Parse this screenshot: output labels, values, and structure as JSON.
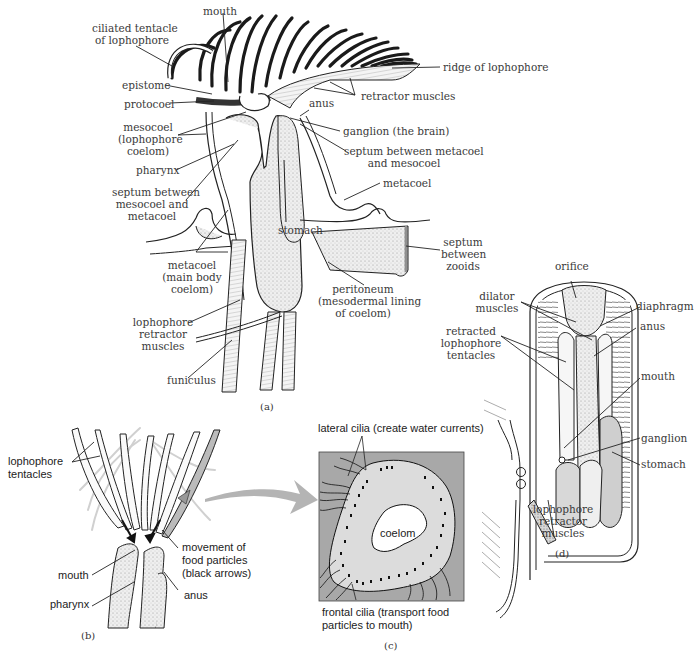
{
  "figure": {
    "panels": [
      {
        "id": "a",
        "caption": "(a)",
        "labels": [
          {
            "key": "mouth",
            "lines": [
              "mouth"
            ]
          },
          {
            "key": "ciliated_tentacle",
            "lines": [
              "ciliated tentacle",
              "of lophophore"
            ]
          },
          {
            "key": "epistome",
            "lines": [
              "epistome"
            ]
          },
          {
            "key": "protocoel",
            "lines": [
              "protocoel"
            ]
          },
          {
            "key": "mesocoel",
            "lines": [
              "mesocoel",
              "(lophophore",
              "coelom)"
            ]
          },
          {
            "key": "pharynx",
            "lines": [
              "pharynx"
            ]
          },
          {
            "key": "septum_meso_meta",
            "lines": [
              "septum between",
              "mesocoel and",
              "metacoel"
            ]
          },
          {
            "key": "metacoel_main",
            "lines": [
              "metacoel",
              "(main body",
              "coelom)"
            ]
          },
          {
            "key": "lophophore_retractor",
            "lines": [
              "lophophore",
              "retractor",
              "muscles"
            ]
          },
          {
            "key": "funiculus",
            "lines": [
              "funiculus"
            ]
          },
          {
            "key": "ridge",
            "lines": [
              "ridge of lophophore"
            ]
          },
          {
            "key": "retractor_muscles",
            "lines": [
              "retractor muscles"
            ]
          },
          {
            "key": "anus",
            "lines": [
              "anus"
            ]
          },
          {
            "key": "ganglion",
            "lines": [
              "ganglion (the brain)"
            ]
          },
          {
            "key": "septum_meta_meso",
            "lines": [
              "septum between metacoel",
              "and mesocoel"
            ]
          },
          {
            "key": "metacoel",
            "lines": [
              "metacoel"
            ]
          },
          {
            "key": "stomach",
            "lines": [
              "stomach"
            ]
          },
          {
            "key": "septum_zooids",
            "lines": [
              "septum",
              "between",
              "zooids"
            ]
          },
          {
            "key": "peritoneum",
            "lines": [
              "peritoneum",
              "(mesodermal lining",
              "of coelom)"
            ]
          }
        ]
      },
      {
        "id": "b",
        "caption": "(b)",
        "labels": [
          {
            "key": "tentacles",
            "lines": [
              "lophophore",
              "tentacles"
            ]
          },
          {
            "key": "movement",
            "lines": [
              "movement of",
              "food particles",
              "(black arrows)"
            ]
          },
          {
            "key": "mouth",
            "lines": [
              "mouth"
            ]
          },
          {
            "key": "pharynx",
            "lines": [
              "pharynx"
            ]
          },
          {
            "key": "anus",
            "lines": [
              "anus"
            ]
          }
        ]
      },
      {
        "id": "c",
        "caption": "(c)",
        "labels": [
          {
            "key": "lateral_cilia",
            "lines": [
              "lateral cilia (create water currents)"
            ]
          },
          {
            "key": "coelom",
            "lines": [
              "coelom"
            ]
          },
          {
            "key": "frontal_cilia",
            "lines": [
              "frontal cilia (transport food",
              "particles to mouth)"
            ]
          }
        ]
      },
      {
        "id": "d",
        "caption": "(d)",
        "labels": [
          {
            "key": "orifice",
            "lines": [
              "orifice"
            ]
          },
          {
            "key": "dilator",
            "lines": [
              "dilator",
              "muscles"
            ]
          },
          {
            "key": "diaphragm",
            "lines": [
              "diaphragm"
            ]
          },
          {
            "key": "anus",
            "lines": [
              "anus"
            ]
          },
          {
            "key": "retracted",
            "lines": [
              "retracted",
              "lophophore",
              "tentacles"
            ]
          },
          {
            "key": "mouth",
            "lines": [
              "mouth"
            ]
          },
          {
            "key": "ganglion",
            "lines": [
              "ganglion"
            ]
          },
          {
            "key": "stomach",
            "lines": [
              "stomach"
            ]
          },
          {
            "key": "retractor",
            "lines": [
              "lophophore",
              "retractor",
              "muscles"
            ]
          }
        ]
      }
    ]
  },
  "colors": {
    "ink": "#222222",
    "label_text": "#3a3a3a",
    "stipple_fill": "#e6e6e6",
    "panel_c_bg": "#a8a8a8",
    "panel_c_body": "#dcdcdc",
    "arrow_gray": "#b4b4b4",
    "water_arrow": "#d2d2d2"
  }
}
